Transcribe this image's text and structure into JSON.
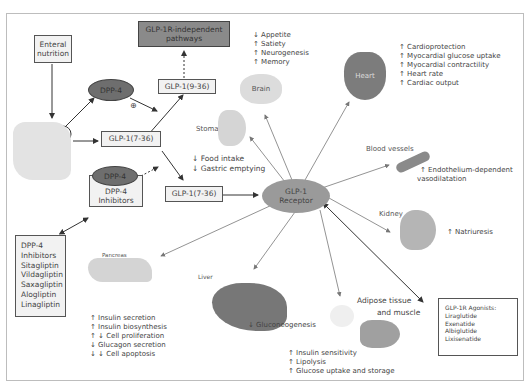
{
  "diagram": {
    "nodes": {
      "enteral": "Enteral\nnutrition",
      "dpp4_top": "DPP-4",
      "plus": "⊕",
      "glp_independent": "GLP-1R-independent\npathways",
      "glp_9_36": "GLP-1(9-36)",
      "glp_7_36_a": "GLP-1(7-36)",
      "glp_7_36_b": "GLP-1(7-36)",
      "dpp4_inhib_ellipse": "DPP-4",
      "dpp4_inhib_box": "DPP-4\nInhibitors",
      "receptor": "GLP-1\nReceptor"
    },
    "dpp4_inhibitors_list": [
      "DPP-4",
      "Inhibitors",
      "Sitagliptin",
      "Vildagliptin",
      "Saxagliptin",
      "Alogliptin",
      "Linagliptin"
    ],
    "agonists": {
      "title": "GLP-1R Agonists:",
      "items": [
        "Liraglutide",
        "Exenatide",
        "Albiglutide",
        "Lixisenatide"
      ]
    },
    "organs": {
      "brain": {
        "label": "Brain",
        "effects": [
          "↓ Appetite",
          "↑ Satiety",
          "↑ Neurogenesis",
          "↑ Memory"
        ]
      },
      "heart": {
        "label": "Heart",
        "effects": [
          "↑ Cardioprotection",
          "↑ Myocardial glucose uptake",
          "↑ Myocardial contractility",
          "↑ Heart rate",
          "↑ Cardiac output"
        ]
      },
      "stomach": {
        "label": "Stomach",
        "effects": [
          "↓ Food intake",
          "↓ Gastric emptying"
        ]
      },
      "blood_vessels": {
        "label": "Blood vessels",
        "effects": [
          "↑ Endothelium-dependent",
          "vasodilatation"
        ]
      },
      "kidney": {
        "label": "Kidney",
        "effects": [
          "↑ Natriuresis"
        ]
      },
      "pancreas": {
        "label": "Pancreas",
        "effects": [
          "↑ Insulin secretion",
          "↑ Insulin biosynthesis",
          "↑ ↓ Cell proliferation",
          "↓ Glucagon secretion",
          "↓ ↓ Cell apoptosis"
        ]
      },
      "liver": {
        "label": "Liver",
        "effects": [
          "↓ Gluconeogenesis"
        ]
      },
      "adipose": {
        "label1": "Adipose tissue",
        "label2": "and muscle",
        "effects": [
          "↑ Insulin sensitivity",
          "↑ Lipolysis",
          "↑ Glucose uptake and storage"
        ]
      }
    }
  }
}
